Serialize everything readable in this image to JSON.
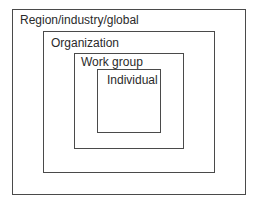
{
  "diagram": {
    "type": "nested-boxes",
    "levels": [
      {
        "label": "Region/industry/global"
      },
      {
        "label": "Organization"
      },
      {
        "label": "Work group"
      },
      {
        "label": "Individual"
      }
    ]
  }
}
